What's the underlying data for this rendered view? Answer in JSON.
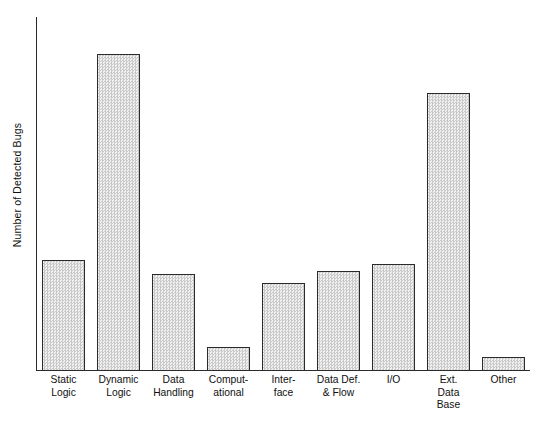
{
  "chart_data": {
    "type": "bar",
    "title": "",
    "subtitle": "",
    "xlabel": "",
    "ylabel": "Number of Detected Bugs",
    "categories": [
      "Static\nLogic",
      "Dynamic\nLogic",
      "Data\nHandling",
      "Comput-\national",
      "Inter-\nface",
      "Data Def.\n& Flow",
      "I/O",
      "Ext.\nData\nBase",
      "Other"
    ],
    "values": [
      111,
      317,
      97,
      24,
      88,
      100,
      107,
      278,
      14
    ],
    "ylim": [
      0,
      354
    ],
    "grid": false,
    "legend": null,
    "axis_ticks": {
      "y": [],
      "x": []
    },
    "style": {
      "bar_fill": "#e6e6e6",
      "bar_pattern": "checker-dither",
      "bar_border": "#2b2b2b",
      "axis_color": "#2a2a2a",
      "background": "#ffffff"
    },
    "geometry": {
      "bar_width": 43,
      "bar_pitch": 55,
      "first_bar_left": 6,
      "plot_width": 494,
      "plot_height": 354
    }
  }
}
